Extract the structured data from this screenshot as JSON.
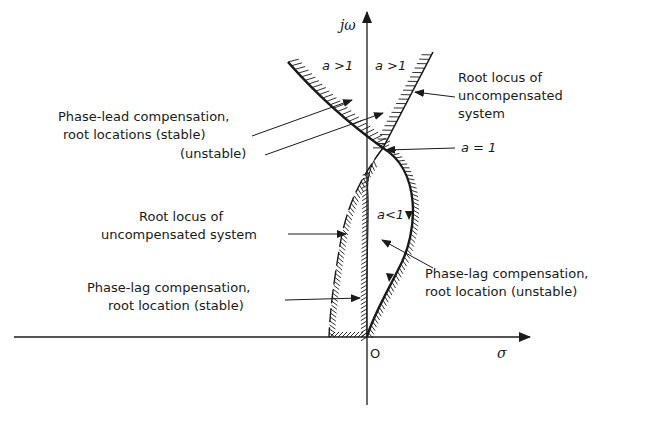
{
  "axes": {
    "vertical_label": "jω",
    "horizontal_label": "σ",
    "origin_label": "O"
  },
  "regions": {
    "upper_left": "a >1",
    "upper_right": "a >1",
    "lower": "a<1",
    "junction": "a = 1"
  },
  "annotations": {
    "phase_lead": {
      "line1": "Phase-lead compensation,",
      "line2": "root locations (stable)",
      "line3": "(unstable)"
    },
    "root_locus_upper": {
      "line1": "Root locus of",
      "line2": "uncompensated",
      "line3": "system"
    },
    "root_locus_lower": {
      "line1": "Root locus of",
      "line2": "uncompensated system"
    },
    "phase_lag_stable": {
      "line1": "Phase-lag compensation,",
      "line2": "root location (stable)"
    },
    "phase_lag_unstable": {
      "line1": "Phase-lag compensation,",
      "line2": "root location (unstable)"
    }
  },
  "colors": {
    "ink": "#1a1a1a",
    "background": "#ffffff"
  }
}
